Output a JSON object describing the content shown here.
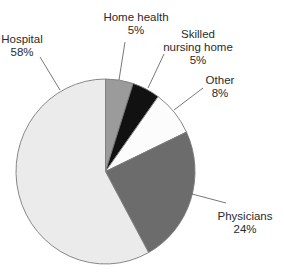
{
  "chart_data": {
    "type": "pie",
    "title": "",
    "start_angle_deg": 0,
    "direction": "clockwise",
    "slices": [
      {
        "label": "Home health",
        "value": 5,
        "display": "5%",
        "color": "#9b9b9b"
      },
      {
        "label": "Skilled nursing home",
        "value": 5,
        "display": "5%",
        "color": "#111111"
      },
      {
        "label": "Other",
        "value": 8,
        "display": "8%",
        "color": "#fcfcfc"
      },
      {
        "label": "Physicians",
        "value": 24,
        "display": "24%",
        "color": "#6c6c6c"
      },
      {
        "label": "Hospital",
        "value": 58,
        "display": "58%",
        "color": "#ebebeb"
      }
    ],
    "legend": "none (callout labels with leader lines)",
    "outline_color": "#7a7a7a"
  },
  "labels": {
    "home_health": {
      "line1": "Home health",
      "line2": "5%"
    },
    "skilled_nursing": {
      "line1": "Skilled",
      "line2": "nursing home",
      "line3": "5%"
    },
    "other": {
      "line1": "Other",
      "line2": "8%"
    },
    "physicians": {
      "line1": "Physicians",
      "line2": "24%"
    },
    "hospital": {
      "line1": "Hospital",
      "line2": "58%"
    }
  }
}
